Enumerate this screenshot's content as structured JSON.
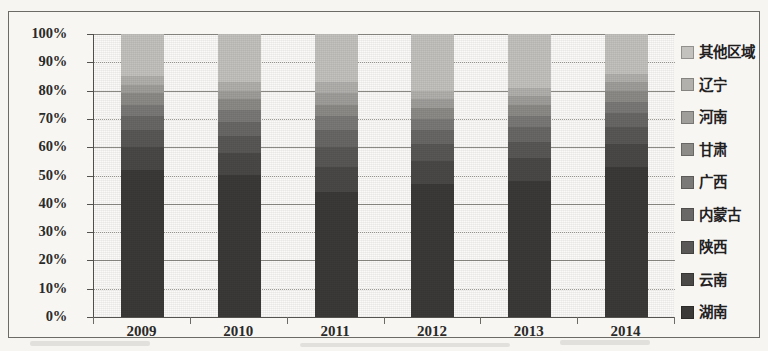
{
  "chart_data": {
    "type": "bar",
    "subtype": "100% stacked column",
    "title": "",
    "xlabel": "",
    "ylabel": "",
    "ylim": [
      0,
      100
    ],
    "ytick_labels": [
      "100%",
      "90%",
      "80%",
      "70%",
      "60%",
      "50%",
      "40%",
      "30%",
      "20%",
      "10%",
      "0%"
    ],
    "ytick_values": [
      100,
      90,
      80,
      70,
      60,
      50,
      40,
      30,
      20,
      10,
      0
    ],
    "grid": true,
    "legend_position": "right",
    "categories": [
      "2009",
      "2010",
      "2011",
      "2012",
      "2013",
      "2014"
    ],
    "series": [
      {
        "name": "湖南",
        "color": "#3b3a38",
        "values": [
          52,
          50,
          44,
          47,
          48,
          53
        ]
      },
      {
        "name": "云南",
        "color": "#4a4947",
        "values": [
          8,
          8,
          9,
          8,
          8,
          8
        ]
      },
      {
        "name": "陕西",
        "color": "#595856",
        "values": [
          6,
          6,
          7,
          6,
          6,
          6
        ]
      },
      {
        "name": "内蒙古",
        "color": "#6a6866",
        "values": [
          5,
          5,
          6,
          5,
          5,
          5
        ]
      },
      {
        "name": "广西",
        "color": "#7b7977",
        "values": [
          4,
          4,
          5,
          4,
          4,
          4
        ]
      },
      {
        "name": "甘肃",
        "color": "#8d8b88",
        "values": [
          4,
          4,
          4,
          4,
          4,
          4
        ]
      },
      {
        "name": "河南",
        "color": "#a09e9b",
        "values": [
          3,
          3,
          4,
          3,
          3,
          3
        ]
      },
      {
        "name": "辽宁",
        "color": "#b2b0ad",
        "values": [
          3,
          3,
          4,
          3,
          3,
          3
        ]
      },
      {
        "name": "其他区域",
        "color": "#c4c2bf",
        "values": [
          15,
          17,
          17,
          20,
          19,
          14
        ]
      }
    ],
    "stack_order_bottom_to_top": [
      "湖南",
      "云南",
      "陕西",
      "内蒙古",
      "广西",
      "甘肃",
      "河南",
      "辽宁",
      "其他区域"
    ]
  },
  "legend": {
    "items": [
      {
        "label": "其他区域",
        "color": "#c4c2bf"
      },
      {
        "label": "辽宁",
        "color": "#b2b0ad"
      },
      {
        "label": "河南",
        "color": "#a09e9b"
      },
      {
        "label": "甘肃",
        "color": "#8d8b88"
      },
      {
        "label": "广西",
        "color": "#7b7977"
      },
      {
        "label": "内蒙古",
        "color": "#6a6866"
      },
      {
        "label": "陕西",
        "color": "#595856"
      },
      {
        "label": "云南",
        "color": "#4a4947"
      },
      {
        "label": "湖南",
        "color": "#3b3a38"
      }
    ]
  }
}
